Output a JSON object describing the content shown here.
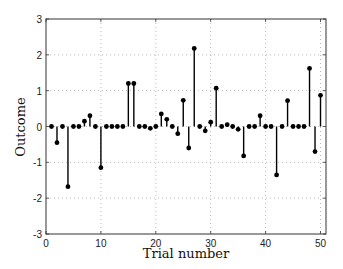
{
  "chart_data": {
    "type": "stem",
    "title": "",
    "xlabel": "Trial number",
    "ylabel": "Outcome",
    "xlim": [
      0,
      51
    ],
    "ylim": [
      -3,
      3
    ],
    "xticks": [
      0,
      10,
      20,
      30,
      40,
      50
    ],
    "yticks": [
      -3,
      -2,
      -1,
      0,
      1,
      2,
      3
    ],
    "grid": true,
    "grid_style": "dotted",
    "legend": null,
    "series": [
      {
        "name": "Outcome",
        "color": "#000000",
        "x": [
          1,
          2,
          3,
          4,
          5,
          6,
          7,
          8,
          9,
          10,
          11,
          12,
          13,
          14,
          15,
          16,
          17,
          18,
          19,
          20,
          21,
          22,
          23,
          24,
          25,
          26,
          27,
          28,
          29,
          30,
          31,
          32,
          33,
          34,
          35,
          36,
          37,
          38,
          39,
          40,
          41,
          42,
          43,
          44,
          45,
          46,
          47,
          48,
          49,
          50
        ],
        "values": [
          0,
          -0.45,
          0,
          -1.68,
          0,
          0,
          0.15,
          0.3,
          0,
          -1.15,
          0,
          0,
          0,
          0,
          1.2,
          1.2,
          0,
          0,
          -0.05,
          0,
          0.35,
          0.2,
          0,
          -0.2,
          0.73,
          -0.6,
          2.18,
          0,
          -0.12,
          0.12,
          1.07,
          0,
          0.05,
          0,
          -0.08,
          -0.82,
          0,
          0,
          0.3,
          0,
          0,
          -1.35,
          0,
          0.72,
          0,
          0,
          0,
          1.62,
          -0.7,
          0.87
        ]
      }
    ]
  }
}
